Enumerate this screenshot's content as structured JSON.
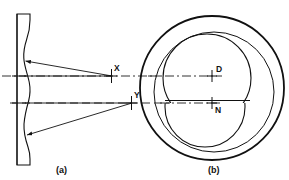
{
  "figure": {
    "title": "",
    "panels": [
      {
        "id": "a",
        "caption": "(a)",
        "caption_x": 59,
        "caption_y": 172,
        "description": "side-section view of curved optic with converging ray bundles",
        "markers": [
          {
            "label": "X",
            "label_x": 116,
            "label_y": 70,
            "cross_x": 111,
            "cross_y": 76
          },
          {
            "label": "Y",
            "label_x": 136,
            "label_y": 97,
            "cross_x": 131,
            "cross_y": 103
          }
        ]
      },
      {
        "id": "b",
        "caption": "(b)",
        "caption_x": 211,
        "caption_y": 172,
        "description": "front view showing outer rim circle, inner circle and two overlapping zone circles",
        "markers": [
          {
            "label": "D",
            "label_x": 218,
            "label_y": 71,
            "cross_x": 212,
            "cross_y": 76
          },
          {
            "label": "N",
            "label_x": 218,
            "label_y": 112,
            "cross_x": 212,
            "cross_y": 104
          }
        ]
      }
    ],
    "colors": {
      "line": "#111111",
      "background": "#ffffff",
      "centerline": "#444444"
    },
    "geometry": {
      "outer_circle": {
        "cx": 212,
        "cy": 88,
        "r": 72
      },
      "inner_circle": {
        "cx": 214,
        "cy": 92,
        "r": 60
      },
      "zone_upper_circle": {
        "cx": 207,
        "cy": 78,
        "r": 44
      },
      "zone_lower_circle": {
        "cx": 205,
        "cy": 107,
        "r": 40
      },
      "centerline_upper_y": 76,
      "centerline_lower_y": 103
    }
  }
}
